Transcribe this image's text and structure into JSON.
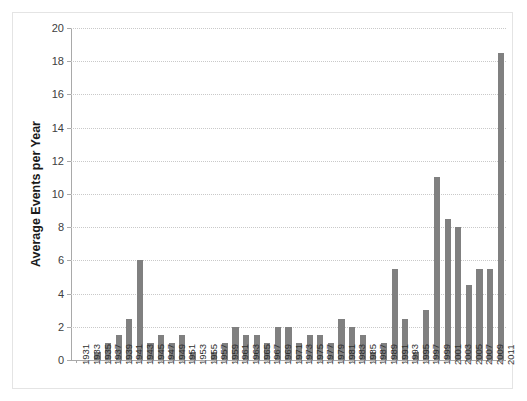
{
  "chart_data": {
    "type": "bar",
    "title": "",
    "xlabel": "",
    "ylabel": "Average Events per Year",
    "ylim": [
      0,
      20
    ],
    "ytick_labels": [
      "0",
      "2",
      "4",
      "6",
      "8",
      "10",
      "12",
      "14",
      "16",
      "18",
      "20"
    ],
    "ytick_values": [
      0,
      2,
      4,
      6,
      8,
      10,
      12,
      14,
      16,
      18,
      20
    ],
    "grid": true,
    "legend": "none",
    "bar_color": "#808080",
    "categories": [
      "1931",
      "1933",
      "1935",
      "1937",
      "1939",
      "1941",
      "1943",
      "1945",
      "1947",
      "1949",
      "1951",
      "1953",
      "1955",
      "1957",
      "1959",
      "1961",
      "1963",
      "1965",
      "1967",
      "1969",
      "1971",
      "1973",
      "1975",
      "1977",
      "1979",
      "1981",
      "1983",
      "1985",
      "1987",
      "1989",
      "1991",
      "1993",
      "1995",
      "1997",
      "1999",
      "2001",
      "2003",
      "2005",
      "2007",
      "2009",
      "2011"
    ],
    "values": [
      0,
      0,
      0.5,
      1,
      1.5,
      2.5,
      6,
      1,
      1.5,
      1,
      1.5,
      0.5,
      0,
      0.5,
      1,
      2,
      1.5,
      1.5,
      1,
      2,
      2,
      1,
      1.5,
      1.5,
      1,
      2.5,
      2,
      1.5,
      0.5,
      1,
      5.5,
      2.5,
      0.5,
      3,
      11,
      8.5,
      8,
      4.5,
      5.5,
      5.5,
      18.5
    ]
  }
}
